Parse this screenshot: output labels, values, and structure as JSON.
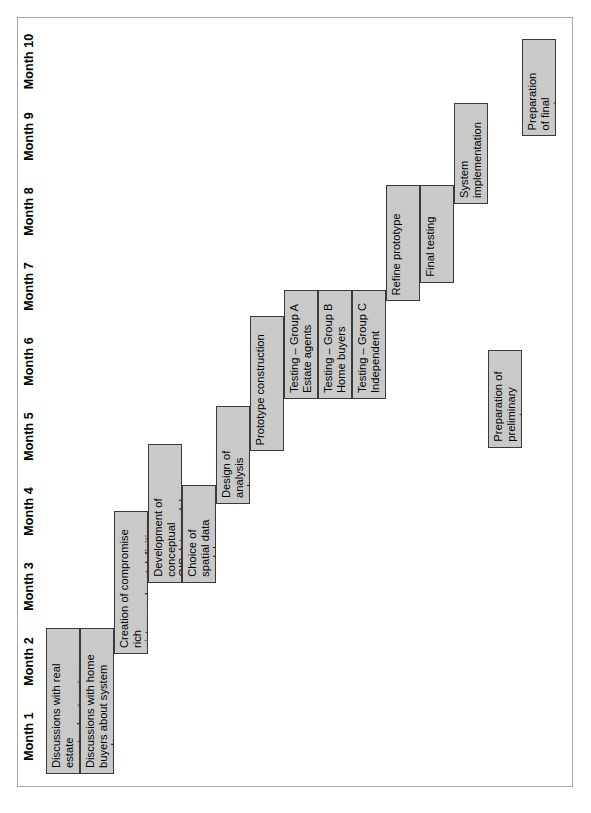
{
  "chart_data": {
    "type": "bar",
    "chart_kind": "gantt",
    "title": "",
    "xlabel": "",
    "ylabel": "",
    "orientation": "page-rotated-90ccw",
    "grid": false,
    "legend": "none",
    "axis": {
      "unit": "month",
      "min": 1,
      "max": 11,
      "tick_labels": [
        "Month 1",
        "Month 2",
        "Month 3",
        "Month 4",
        "Month 5",
        "Month 6",
        "Month 7",
        "Month 8",
        "Month 9",
        "Month 10"
      ]
    },
    "bar_fill_color": "#c9c9c9",
    "bar_border_color": "#3a3a3a",
    "categories": [
      "Discussions with real estate agents about system needs",
      "Discussions with home buyers about system needs",
      "Creation of compromise rich picture and root definition",
      "Development of conceptual GIS data model",
      "Choice of spatial data model",
      "Design of analysis scheme",
      "Prototype construction",
      "Testing – Group A Estate agents",
      "Testing – Group B Home buyers",
      "Testing – Group C Independent",
      "Refine prototype",
      "Final testing",
      "System implementation",
      "Preparation of preliminary report",
      "Preparation of final report"
    ],
    "tasks": [
      {
        "label": "Discussions with real estate\nagents about system needs",
        "row": 0,
        "start_month": 1.0,
        "end_month": 2.95,
        "duration_months": 1.95
      },
      {
        "label": "Discussions with home\nbuyers about system needs",
        "row": 1,
        "start_month": 1.0,
        "end_month": 2.95,
        "duration_months": 1.95
      },
      {
        "label": "Creation of compromise rich\npicture and root definition",
        "row": 2,
        "start_month": 2.6,
        "end_month": 4.5,
        "duration_months": 1.9
      },
      {
        "label": "Development of conceptual\nGIS data model",
        "row": 3,
        "start_month": 3.55,
        "end_month": 5.4,
        "duration_months": 1.85
      },
      {
        "label": "Choice of\nspatial data\nmodel",
        "row": 4,
        "start_month": 3.55,
        "end_month": 4.85,
        "duration_months": 1.3
      },
      {
        "label": "Design of\nanalysis\nscheme",
        "row": 5,
        "start_month": 4.6,
        "end_month": 5.9,
        "duration_months": 1.3
      },
      {
        "label": "Prototype construction",
        "row": 6,
        "start_month": 5.3,
        "end_month": 7.1,
        "duration_months": 1.8
      },
      {
        "label": "Testing – Group A\nEstate agents",
        "row": 7,
        "start_month": 6.0,
        "end_month": 7.45,
        "duration_months": 1.45
      },
      {
        "label": "Testing – Group B\nHome buyers",
        "row": 8,
        "start_month": 6.0,
        "end_month": 7.45,
        "duration_months": 1.45
      },
      {
        "label": "Testing – Group C\nIndependent",
        "row": 9,
        "start_month": 6.0,
        "end_month": 7.45,
        "duration_months": 1.45
      },
      {
        "label": "Refine prototype",
        "row": 10,
        "start_month": 7.3,
        "end_month": 8.85,
        "duration_months": 1.55
      },
      {
        "label": "Final testing",
        "row": 11,
        "start_month": 7.55,
        "end_month": 8.85,
        "duration_months": 1.3
      },
      {
        "label": "System\nimplementation",
        "row": 12,
        "start_month": 8.6,
        "end_month": 9.95,
        "duration_months": 1.35
      },
      {
        "label": "Preparation of\npreliminary\nreport",
        "row": 13,
        "start_month": 5.35,
        "end_month": 6.65,
        "duration_months": 1.3
      },
      {
        "label": "Preparation\nof final\nreport",
        "row": 14,
        "start_month": 9.5,
        "end_month": 10.8,
        "duration_months": 1.3
      }
    ]
  }
}
